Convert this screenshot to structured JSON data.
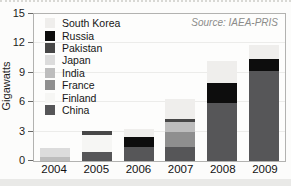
{
  "chart_data": {
    "type": "bar",
    "stacked": true,
    "title": "",
    "ylabel": "Gigawatts",
    "xlabel": "",
    "ylim": [
      0,
      15
    ],
    "yticks": [
      0,
      3,
      6,
      9,
      12,
      15
    ],
    "grid": "faint horizontal",
    "legend_position": "top-left inside plot",
    "source": "Source: IAEA-PRIS",
    "categories": [
      "2004",
      "2005",
      "2006",
      "2007",
      "2008",
      "2009"
    ],
    "legend_order": [
      "South Korea",
      "Russia",
      "Pakistan",
      "Japan",
      "India",
      "France",
      "Finland",
      "China"
    ],
    "colors": {
      "South Korea": "#efeeec",
      "Russia": "#0d0d0d",
      "Pakistan": "#474747",
      "Japan": "#dcdcdc",
      "India": "#bdbdbd",
      "France": "#8f8f8f",
      "Finland": "#f6f6f4",
      "China": "#565658"
    },
    "stack_order_note": "series listed bottom-to-top of each bar",
    "series": [
      {
        "name": "China",
        "values": [
          0,
          0.95,
          1.45,
          1.45,
          5.9,
          9.2
        ]
      },
      {
        "name": "Finland",
        "values": [
          0,
          1.75,
          0,
          0,
          0,
          0
        ]
      },
      {
        "name": "France",
        "values": [
          0,
          0,
          0,
          1.55,
          0,
          0
        ]
      },
      {
        "name": "India",
        "values": [
          0.4,
          0,
          0,
          0.95,
          0,
          0
        ]
      },
      {
        "name": "Japan",
        "values": [
          0.9,
          0,
          0,
          0,
          0,
          0
        ]
      },
      {
        "name": "Pakistan",
        "values": [
          0,
          0.4,
          0,
          0.3,
          0,
          0
        ]
      },
      {
        "name": "Russia",
        "values": [
          0,
          0,
          1.0,
          0,
          2.1,
          1.2
        ]
      },
      {
        "name": "South Korea",
        "values": [
          0,
          0,
          0.85,
          2.1,
          2.2,
          1.4
        ]
      }
    ],
    "totals": [
      1.3,
      3.1,
      3.3,
      6.35,
      10.2,
      11.8
    ]
  }
}
